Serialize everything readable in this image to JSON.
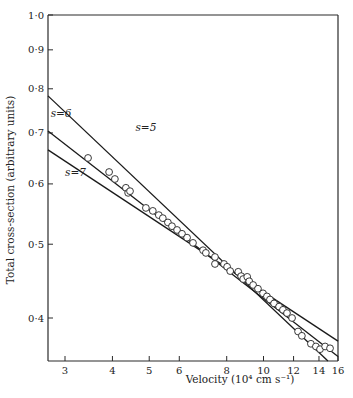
{
  "chart_data": {
    "type": "scatter",
    "title": "",
    "xlabel": "Velocity (10⁴ cm s⁻¹)",
    "ylabel": "Total cross-section (arbitrary units)",
    "xscale": "log",
    "yscale": "log",
    "xlim": [
      2.7,
      16
    ],
    "ylim": [
      0.345,
      1.0
    ],
    "x_ticks": [
      3,
      4,
      5,
      6,
      8,
      10,
      12,
      14,
      16
    ],
    "x_tick_labels": [
      "3",
      "4",
      "5",
      "6",
      "8",
      "10",
      "12",
      "14",
      "16"
    ],
    "y_ticks": [
      0.4,
      0.5,
      0.6,
      0.7,
      0.8,
      0.9,
      1.0
    ],
    "y_tick_labels": [
      "0·4",
      "0·5",
      "0·6",
      "0·7",
      "0·8",
      "0·9",
      "1·0"
    ],
    "grid": false,
    "legend": "none",
    "series": [
      {
        "name": "measurements",
        "kind": "scatter",
        "marker": "open-circle",
        "points": [
          [
            3.45,
            0.649
          ],
          [
            3.92,
            0.622
          ],
          [
            4.06,
            0.609
          ],
          [
            4.34,
            0.593
          ],
          [
            4.4,
            0.584
          ],
          [
            4.45,
            0.587
          ],
          [
            4.9,
            0.558
          ],
          [
            5.11,
            0.553
          ],
          [
            5.3,
            0.546
          ],
          [
            5.43,
            0.541
          ],
          [
            5.6,
            0.534
          ],
          [
            5.74,
            0.528
          ],
          [
            5.92,
            0.522
          ],
          [
            6.1,
            0.516
          ],
          [
            6.29,
            0.51
          ],
          [
            6.52,
            0.502
          ],
          [
            6.93,
            0.491
          ],
          [
            7.05,
            0.487
          ],
          [
            7.45,
            0.481
          ],
          [
            7.45,
            0.471
          ],
          [
            7.87,
            0.471
          ],
          [
            8.02,
            0.467
          ],
          [
            8.17,
            0.461
          ],
          [
            8.58,
            0.46
          ],
          [
            8.73,
            0.454
          ],
          [
            8.84,
            0.45
          ],
          [
            9.06,
            0.453
          ],
          [
            9.17,
            0.447
          ],
          [
            9.39,
            0.442
          ],
          [
            9.67,
            0.437
          ],
          [
            9.97,
            0.431
          ],
          [
            10.21,
            0.427
          ],
          [
            10.4,
            0.423
          ],
          [
            10.66,
            0.418
          ],
          [
            10.99,
            0.414
          ],
          [
            11.25,
            0.41
          ],
          [
            11.53,
            0.406
          ],
          [
            11.89,
            0.4
          ],
          [
            12.33,
            0.384
          ],
          [
            12.62,
            0.379
          ],
          [
            13.33,
            0.37
          ],
          [
            13.74,
            0.367
          ],
          [
            14.09,
            0.364
          ],
          [
            14.53,
            0.367
          ],
          [
            14.97,
            0.365
          ]
        ]
      },
      {
        "name": "s=5",
        "kind": "line",
        "label": "s=5",
        "label_at": [
          4.6,
          0.705
        ],
        "points": [
          [
            2.7,
            0.783
          ],
          [
            14.78,
            0.351
          ]
        ]
      },
      {
        "name": "s=6",
        "kind": "line",
        "label": "s=6",
        "label_at": [
          2.75,
          0.735
        ],
        "points": [
          [
            2.7,
            0.704
          ],
          [
            15.9,
            0.356
          ]
        ]
      },
      {
        "name": "s=7",
        "kind": "line",
        "label": "s=7",
        "label_at": [
          3.0,
          0.615
        ],
        "points": [
          [
            2.7,
            0.665
          ],
          [
            15.9,
            0.373
          ]
        ]
      }
    ]
  }
}
